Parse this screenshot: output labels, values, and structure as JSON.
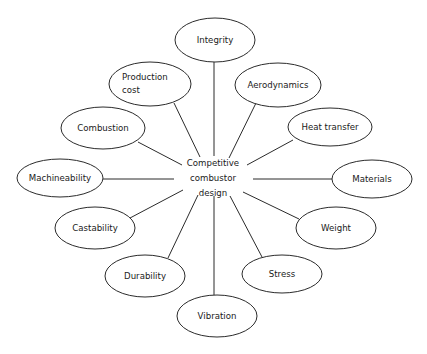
{
  "diagram": {
    "type": "radial-spoke-map",
    "title": "Competitive combustor design",
    "background_color": "#ffffff",
    "line_color": "#2b2b2b",
    "text_color": "#1a1a1a",
    "hub": {
      "name": "hub-node",
      "lines": [
        "Competitive",
        "combustor",
        "design"
      ],
      "line1": "Competitive",
      "line2": "combustor",
      "line3": "design",
      "cx": 213,
      "cy": 178
    },
    "nodes": [
      {
        "id": "integrity",
        "label": "Integrity",
        "lines": [
          "Integrity"
        ],
        "cx": 215,
        "cy": 40,
        "rx": 40,
        "ry": 22,
        "label_align": "centered",
        "link": {
          "x1": 214,
          "y1": 62,
          "x2": 214,
          "y2": 156
        }
      },
      {
        "id": "aerodynamics",
        "label": "Aerodynamics",
        "lines": [
          "Aerodynamics"
        ],
        "cx": 278,
        "cy": 85,
        "rx": 43,
        "ry": 22,
        "label_align": "centered",
        "link": {
          "x1": 256,
          "y1": 103,
          "x2": 229,
          "y2": 158
        }
      },
      {
        "id": "heat-transfer",
        "label": "Heat transfer",
        "lines": [
          "Heat transfer"
        ],
        "cx": 330,
        "cy": 127,
        "rx": 42,
        "ry": 19,
        "label_align": "centered",
        "link": {
          "x1": 293,
          "y1": 140,
          "x2": 247,
          "y2": 165
        }
      },
      {
        "id": "materials",
        "label": "Materials",
        "lines": [
          "Materials"
        ],
        "cx": 372,
        "cy": 179,
        "rx": 40,
        "ry": 19,
        "label_align": "centered",
        "link": {
          "x1": 332,
          "y1": 179,
          "x2": 253,
          "y2": 179
        }
      },
      {
        "id": "weight",
        "label": "Weight",
        "lines": [
          "Weight"
        ],
        "cx": 336,
        "cy": 228,
        "rx": 40,
        "ry": 21,
        "label_align": "centered",
        "link": {
          "x1": 299,
          "y1": 219,
          "x2": 243,
          "y2": 192
        }
      },
      {
        "id": "stress",
        "label": "Stress",
        "lines": [
          "Stress"
        ],
        "cx": 282,
        "cy": 274,
        "rx": 40,
        "ry": 19,
        "label_align": "centered",
        "link": {
          "x1": 262,
          "y1": 257,
          "x2": 230,
          "y2": 196
        }
      },
      {
        "id": "vibration",
        "label": "Vibration",
        "lines": [
          "Vibration"
        ],
        "cx": 217,
        "cy": 316,
        "rx": 40,
        "ry": 21,
        "label_align": "centered",
        "link": {
          "x1": 214,
          "y1": 295,
          "x2": 214,
          "y2": 196
        }
      },
      {
        "id": "durability",
        "label": "Durability",
        "lines": [
          "Durability"
        ],
        "cx": 145,
        "cy": 276,
        "rx": 40,
        "ry": 21,
        "label_align": "centered",
        "link": {
          "x1": 168,
          "y1": 258,
          "x2": 198,
          "y2": 195
        }
      },
      {
        "id": "castability",
        "label": "Castability",
        "lines": [
          "Castability"
        ],
        "cx": 95,
        "cy": 228,
        "rx": 40,
        "ry": 21,
        "label_align": "centered",
        "link": {
          "x1": 130,
          "y1": 218,
          "x2": 183,
          "y2": 190
        }
      },
      {
        "id": "machineability",
        "label": "Machineability",
        "lines": [
          "Machineability"
        ],
        "cx": 60,
        "cy": 178,
        "rx": 43,
        "ry": 19,
        "label_align": "centered",
        "link": {
          "x1": 103,
          "y1": 179,
          "x2": 174,
          "y2": 179
        }
      },
      {
        "id": "combustion",
        "label": "Combustion",
        "lines": [
          "Combustion"
        ],
        "cx": 103,
        "cy": 128,
        "rx": 42,
        "ry": 21,
        "label_align": "centered",
        "link": {
          "x1": 138,
          "y1": 142,
          "x2": 182,
          "y2": 165
        }
      },
      {
        "id": "production-cost",
        "label": "Production cost",
        "lines": [
          "Production",
          "cost"
        ],
        "cx": 150,
        "cy": 84,
        "rx": 41,
        "ry": 22,
        "label_align": "lefted",
        "link": {
          "x1": 174,
          "y1": 103,
          "x2": 200,
          "y2": 157
        }
      }
    ]
  }
}
